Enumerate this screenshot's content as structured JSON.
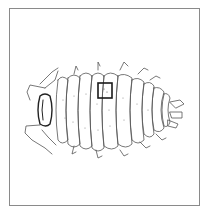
{
  "figure": {
    "highlight_box": {
      "x": 98,
      "y": 83,
      "width": 14,
      "height": 15
    },
    "colors": {
      "line": "#444444",
      "frame": "#8a8a8a",
      "box": "#1a1a1a",
      "background": "#ffffff"
    }
  }
}
